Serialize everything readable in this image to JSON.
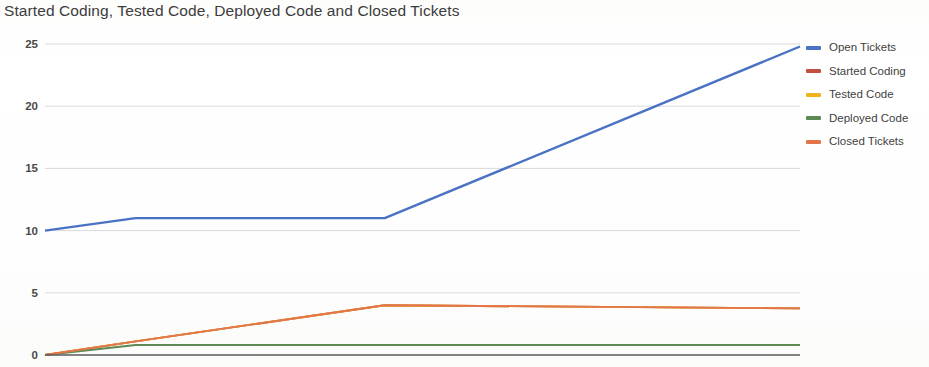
{
  "chart_data": {
    "type": "line",
    "title": "Started Coding, Tested Code, Deployed Code and Closed Tickets",
    "xlabel": "",
    "ylabel": "",
    "ylim": [
      0,
      25
    ],
    "xlim": [
      0,
      10
    ],
    "grid": true,
    "gridlines_y": [
      0,
      5,
      10,
      15,
      20,
      25
    ],
    "y_ticks": [
      "0",
      "5",
      "10",
      "15",
      "20",
      "25"
    ],
    "x_ticks": [],
    "legend_position": "right",
    "x": [
      0,
      1.2,
      4.5,
      10
    ],
    "series": [
      {
        "name": "Open Tickets",
        "color": "#4A72C4",
        "values": [
          10,
          11,
          11,
          24.8
        ]
      },
      {
        "name": "Started Coding",
        "color": "#C5503F",
        "values": [
          0,
          1.1,
          4,
          3.75
        ]
      },
      {
        "name": "Tested Code",
        "color": "#F2B31E",
        "values": [
          0,
          1.1,
          4,
          3.75
        ]
      },
      {
        "name": "Deployed Code",
        "color": "#5C8A52",
        "values": [
          0,
          0.8,
          0.8,
          0.8
        ]
      },
      {
        "name": "Closed Tickets",
        "color": "#E2764A",
        "values": [
          0,
          1.1,
          4,
          3.75
        ]
      }
    ],
    "axis_color": "#555555",
    "grid_color": "#d9d9d9",
    "background": "#ffffff"
  },
  "legend": {
    "items": [
      {
        "label": "Open Tickets"
      },
      {
        "label": "Started Coding"
      },
      {
        "label": "Tested Code"
      },
      {
        "label": "Deployed Code"
      },
      {
        "label": "Closed Tickets"
      }
    ]
  }
}
